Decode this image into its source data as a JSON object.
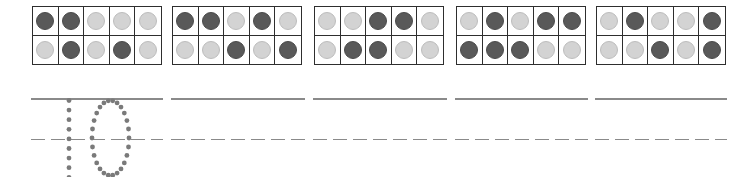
{
  "worksheet": {
    "colors": {
      "dark_counter": "#595959",
      "light_counter": "#d3d3d3",
      "frame_border": "#2e2e2e",
      "line": "#8a8a8a",
      "trace_dots": "#7a7a7a"
    },
    "ten_frames": [
      {
        "top": [
          "dark",
          "dark",
          "light",
          "light",
          "light"
        ],
        "bottom": [
          "light",
          "dark",
          "light",
          "dark",
          "light"
        ]
      },
      {
        "top": [
          "dark",
          "dark",
          "light",
          "dark",
          "light"
        ],
        "bottom": [
          "light",
          "light",
          "dark",
          "light",
          "dark"
        ]
      },
      {
        "top": [
          "light",
          "light",
          "dark",
          "dark",
          "light"
        ],
        "bottom": [
          "light",
          "dark",
          "dark",
          "light",
          "light"
        ]
      },
      {
        "top": [
          "light",
          "dark",
          "light",
          "dark",
          "dark"
        ],
        "bottom": [
          "dark",
          "dark",
          "dark",
          "light",
          "light"
        ]
      },
      {
        "top": [
          "light",
          "dark",
          "light",
          "light",
          "dark"
        ],
        "bottom": [
          "light",
          "light",
          "dark",
          "light",
          "dark"
        ]
      }
    ],
    "traced_number": "10",
    "writing_segments": 5
  }
}
